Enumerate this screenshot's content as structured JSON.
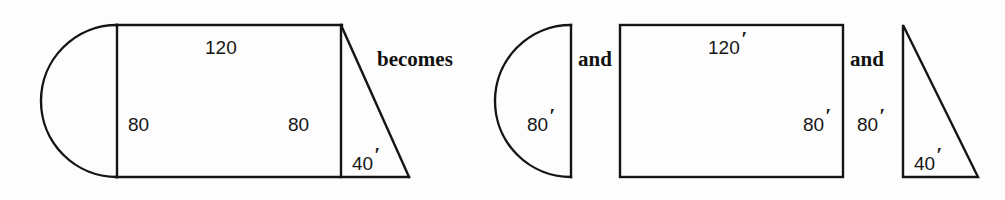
{
  "figure": {
    "background_color": "#fdfdfd",
    "stroke_color": "#151515",
    "connectors": {
      "becomes": "becomes",
      "and_first": "and",
      "and_second": "and"
    },
    "composite_shape": {
      "name": "composite-figure",
      "description": "semicircle joined to rectangle joined to right triangle",
      "labels": {
        "top": "120",
        "left_height": "80",
        "right_height": "80",
        "triangle_base": "40",
        "triangle_base_prime": "′"
      }
    },
    "parts": [
      {
        "name": "semicircle",
        "label": "80",
        "prime": "′"
      },
      {
        "name": "rectangle",
        "label_top": "120",
        "label_top_prime": "′",
        "label_side": "80",
        "label_side_prime": "′"
      },
      {
        "name": "right-triangle",
        "label_height": "80",
        "label_height_prime": "′",
        "label_base": "40",
        "label_base_prime": "′"
      }
    ]
  }
}
